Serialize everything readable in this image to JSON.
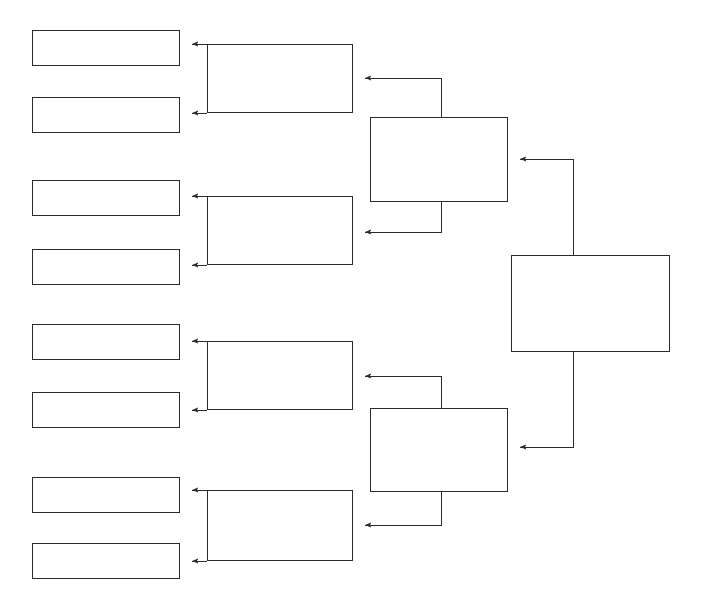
{
  "diagram": {
    "type": "single-elimination-bracket",
    "team_count": 8,
    "round_count": 4,
    "orientation": "right-to-left",
    "background_color": "#ffffff",
    "line_color": "#2b2b2b",
    "box_fill_color": "#ffffff",
    "line_width": 1
  },
  "rounds": [
    {
      "name": "round-1",
      "label": "",
      "slots": [
        {
          "id": "r1s1",
          "label": ""
        },
        {
          "id": "r1s2",
          "label": ""
        },
        {
          "id": "r1s3",
          "label": ""
        },
        {
          "id": "r1s4",
          "label": ""
        },
        {
          "id": "r1s5",
          "label": ""
        },
        {
          "id": "r1s6",
          "label": ""
        },
        {
          "id": "r1s7",
          "label": ""
        },
        {
          "id": "r1s8",
          "label": ""
        }
      ]
    },
    {
      "name": "round-2",
      "label": "",
      "slots": [
        {
          "id": "r2s1",
          "label": ""
        },
        {
          "id": "r2s2",
          "label": ""
        },
        {
          "id": "r2s3",
          "label": ""
        },
        {
          "id": "r2s4",
          "label": ""
        }
      ]
    },
    {
      "name": "round-3",
      "label": "",
      "slots": [
        {
          "id": "r3s1",
          "label": ""
        },
        {
          "id": "r3s2",
          "label": ""
        }
      ]
    },
    {
      "name": "round-4",
      "label": "",
      "slots": [
        {
          "id": "r4s1",
          "label": ""
        }
      ]
    }
  ],
  "geometry": {
    "round1": [
      {
        "x": 32,
        "y": 30,
        "w": 148,
        "h": 36
      },
      {
        "x": 32,
        "y": 97,
        "w": 148,
        "h": 36
      },
      {
        "x": 32,
        "y": 180,
        "w": 148,
        "h": 36
      },
      {
        "x": 32,
        "y": 249,
        "w": 148,
        "h": 36
      },
      {
        "x": 32,
        "y": 324,
        "w": 148,
        "h": 36
      },
      {
        "x": 32,
        "y": 392,
        "w": 148,
        "h": 36
      },
      {
        "x": 32,
        "y": 477,
        "w": 148,
        "h": 36
      },
      {
        "x": 32,
        "y": 543,
        "w": 148,
        "h": 36
      }
    ],
    "round2": [
      {
        "x": 207,
        "y": 44,
        "w": 146,
        "h": 69
      },
      {
        "x": 207,
        "y": 196,
        "w": 146,
        "h": 69
      },
      {
        "x": 207,
        "y": 341,
        "w": 146,
        "h": 69
      },
      {
        "x": 207,
        "y": 490,
        "w": 146,
        "h": 71
      }
    ],
    "round3": [
      {
        "x": 370,
        "y": 117,
        "w": 138,
        "h": 85
      },
      {
        "x": 370,
        "y": 408,
        "w": 138,
        "h": 84
      }
    ],
    "round4": [
      {
        "x": 511,
        "y": 255,
        "w": 159,
        "h": 97
      }
    ]
  }
}
